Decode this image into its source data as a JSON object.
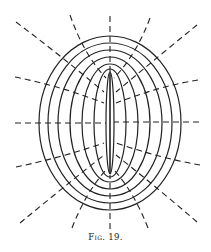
{
  "figure": {
    "caption": "Fig. 19.",
    "stroke_color": "#222222",
    "background": "#ffffff",
    "center": [
      110,
      123
    ],
    "segment": {
      "x": 110,
      "y1": 73,
      "y2": 174
    },
    "ellipses": [
      {
        "rx": 4,
        "ry": 51
      },
      {
        "rx": 16,
        "ry": 54
      },
      {
        "rx": 28,
        "ry": 59
      },
      {
        "rx": 40,
        "ry": 66
      },
      {
        "rx": 52,
        "ry": 73
      },
      {
        "rx": 62,
        "ry": 80
      },
      {
        "rx": 71,
        "ry": 87
      }
    ],
    "dashed_lines": [
      {
        "id": "top-center",
        "path": "M110,16 L110,72"
      },
      {
        "id": "top-left-1",
        "path": "M70,15 Q84,55 106,78"
      },
      {
        "id": "top-right-1",
        "path": "M150,18 Q136,55 114,78"
      },
      {
        "id": "top-left-2",
        "path": "M16,22 Q60,55 104,92"
      },
      {
        "id": "top-right-2",
        "path": "M197,25 Q160,55 116,92"
      },
      {
        "id": "left-upper",
        "path": "M15,77 Q60,86 104,103"
      },
      {
        "id": "right-upper",
        "path": "M198,80 Q160,86 116,103"
      },
      {
        "id": "left-mid",
        "path": "M15,123 L106,123"
      },
      {
        "id": "right-mid",
        "path": "M199,122 L114,122"
      },
      {
        "id": "left-lower",
        "path": "M16,167 Q60,158 104,143"
      },
      {
        "id": "right-lower",
        "path": "M200,165 Q160,158 116,143"
      },
      {
        "id": "bottom-left-2",
        "path": "M20,223 Q60,190 104,155"
      },
      {
        "id": "bottom-right-2",
        "path": "M197,222 Q160,190 116,155"
      },
      {
        "id": "bottom-left-1",
        "path": "M72,228 Q86,192 106,170"
      },
      {
        "id": "bottom-right-1",
        "path": "M148,228 Q134,192 114,170"
      },
      {
        "id": "bottom-center",
        "path": "M110,229 L110,175"
      }
    ]
  }
}
